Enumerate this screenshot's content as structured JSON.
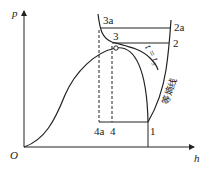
{
  "diagram": {
    "axes": {
      "y_label": "p",
      "x_label": "h",
      "origin": "O"
    },
    "points": {
      "p1": "1",
      "p2": "2",
      "p2a": "2a",
      "p3": "3",
      "p3a": "3a",
      "p4": "4",
      "p4a": "4a"
    },
    "curve_labels": {
      "isotherm": "t = t₃",
      "isentrope": "等熵线"
    },
    "colors": {
      "line": "#222222",
      "background": "#ffffff"
    }
  }
}
